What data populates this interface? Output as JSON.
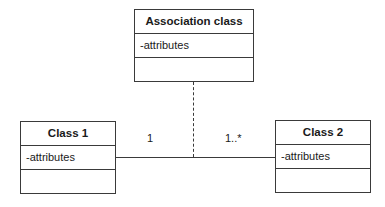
{
  "diagram": {
    "type": "UML class diagram with association class",
    "association_class": {
      "name": "Association class",
      "attributes": "-attributes",
      "operations": ""
    },
    "class1": {
      "name": "Class 1",
      "attributes": "-attributes",
      "operations": ""
    },
    "class2": {
      "name": "Class 2",
      "attributes": "-attributes",
      "operations": ""
    },
    "association": {
      "class1_multiplicity": "1",
      "class2_multiplicity": "1..*"
    },
    "colors": {
      "line": "#3a3a3a",
      "background": "#ffffff",
      "text": "#1a1a1a"
    }
  }
}
